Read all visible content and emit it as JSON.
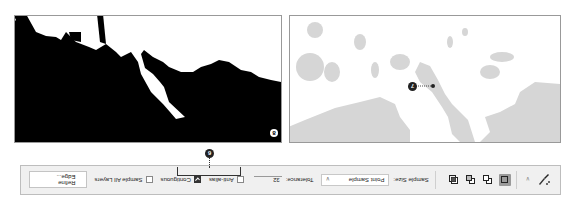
{
  "orientation": "rotated-180",
  "toolbar": {
    "tool_icon": "quick-selection-brush-icon",
    "tool_dropdown_icon": "chevron-down-icon",
    "selection_modes": [
      {
        "name": "new-selection",
        "active": true
      },
      {
        "name": "add-to-selection",
        "active": false
      },
      {
        "name": "subtract-from-selection",
        "active": false
      },
      {
        "name": "intersect-with-selection",
        "active": false
      }
    ],
    "sample_size_label": "Sample Size:",
    "sample_size_value": "Point Sample",
    "tolerance_label": "Tolerance:",
    "tolerance_value": "32",
    "anti_alias_label": "Anti-alias",
    "anti_alias_checked": false,
    "contiguous_label": "Contiguous",
    "contiguous_checked": true,
    "sample_all_layers_label": "Sample All Layers",
    "sample_all_layers_checked": false,
    "refine_edge_label": "Refine Edge..."
  },
  "callouts": {
    "contiguous": "6",
    "click_point": "7",
    "mask_panel": "8"
  },
  "panels": {
    "image_panel": {
      "description": "Image with gray regions; selection click point"
    },
    "mask_panel": {
      "description": "Black/white selection mask result"
    }
  },
  "colors": {
    "toolbar_bg": "#f0f0f0",
    "gray_region": "#d4d4d4",
    "mask_black": "#000000",
    "mask_white": "#ffffff",
    "active_mode": "#9a9a9a"
  }
}
